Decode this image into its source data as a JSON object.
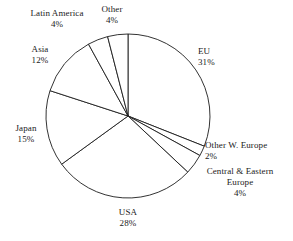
{
  "chart_data": {
    "type": "pie",
    "title": "",
    "subtitle": "",
    "xlabel": "",
    "ylabel": "",
    "units": "percent",
    "legend_position": "none",
    "grid": false,
    "label_format": "name above value, value as percent",
    "start_angle_deg": 0,
    "direction": "clockwise",
    "total": 100,
    "categories": [
      "EU",
      "Other W. Europe",
      "Central & Eastern Europe",
      "USA",
      "Japan",
      "Asia",
      "Latin America",
      "Other"
    ],
    "values": [
      31,
      2,
      4,
      28,
      15,
      12,
      4,
      4
    ],
    "slices": [
      {
        "label": "EU",
        "value": 31,
        "value_text": "31%"
      },
      {
        "label": "Other W. Europe",
        "value": 2,
        "value_text": "2%"
      },
      {
        "label": "Central & Eastern",
        "label_line2": "Europe",
        "value": 4,
        "value_text": "4%"
      },
      {
        "label": "USA",
        "value": 28,
        "value_text": "28%"
      },
      {
        "label": "Japan",
        "value": 15,
        "value_text": "15%"
      },
      {
        "label": "Asia",
        "value": 12,
        "value_text": "12%"
      },
      {
        "label": "Latin America",
        "value": 4,
        "value_text": "4%"
      },
      {
        "label": "Other",
        "value": 4,
        "value_text": "4%"
      }
    ],
    "colors": {
      "slice_fill": "#ffffff",
      "slice_stroke": "#1c1c1c",
      "background": "#ffffff",
      "text": "#1a1a1a"
    }
  },
  "labels": {
    "eu": {
      "name": "EU",
      "value": "31%"
    },
    "other_w_europe": {
      "name": "Other W. Europe",
      "value": "2%"
    },
    "central_eastern_europe": {
      "name": "Central & Eastern",
      "name2": "Europe",
      "value": "4%"
    },
    "usa": {
      "name": "USA",
      "value": "28%"
    },
    "japan": {
      "name": "Japan",
      "value": "15%"
    },
    "asia": {
      "name": "Asia",
      "value": "12%"
    },
    "latin_america": {
      "name": "Latin America",
      "value": "4%"
    },
    "other": {
      "name": "Other",
      "value": "4%"
    }
  }
}
